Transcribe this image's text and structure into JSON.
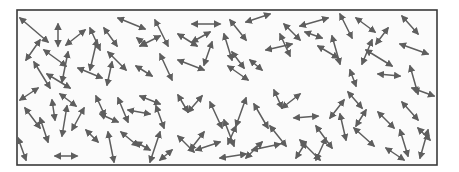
{
  "diagram": {
    "frame": {
      "x": 17,
      "y": 10,
      "width": 420,
      "height": 155
    },
    "colors": {
      "arrow": "#5e5e5e",
      "frame": "#3a3a3a",
      "background": "#fbfbfb"
    },
    "arrow_style": "double-headed",
    "arrows": [
      [
        20,
        18,
        48,
        42
      ],
      [
        58,
        24,
        58,
        46
      ],
      [
        66,
        45,
        85,
        30
      ],
      [
        26,
        60,
        40,
        40
      ],
      [
        44,
        50,
        66,
        66
      ],
      [
        68,
        52,
        62,
        82
      ],
      [
        34,
        62,
        50,
        88
      ],
      [
        47,
        74,
        70,
        88
      ],
      [
        90,
        28,
        100,
        50
      ],
      [
        104,
        28,
        117,
        46
      ],
      [
        97,
        40,
        90,
        70
      ],
      [
        118,
        18,
        145,
        29
      ],
      [
        140,
        46,
        160,
        36
      ],
      [
        108,
        52,
        126,
        70
      ],
      [
        78,
        68,
        102,
        78
      ],
      [
        112,
        62,
        107,
        85
      ],
      [
        137,
        38,
        147,
        46
      ],
      [
        155,
        20,
        168,
        46
      ],
      [
        160,
        54,
        172,
        80
      ],
      [
        136,
        66,
        152,
        76
      ],
      [
        178,
        34,
        197,
        46
      ],
      [
        192,
        24,
        220,
        24
      ],
      [
        192,
        42,
        210,
        32
      ],
      [
        212,
        42,
        204,
        65
      ],
      [
        230,
        20,
        246,
        40
      ],
      [
        224,
        34,
        232,
        60
      ],
      [
        232,
        52,
        244,
        68
      ],
      [
        178,
        60,
        204,
        70
      ],
      [
        228,
        66,
        248,
        80
      ],
      [
        250,
        60,
        262,
        70
      ],
      [
        246,
        22,
        270,
        14
      ],
      [
        284,
        24,
        300,
        40
      ],
      [
        280,
        34,
        290,
        56
      ],
      [
        266,
        50,
        292,
        44
      ],
      [
        300,
        26,
        328,
        18
      ],
      [
        305,
        32,
        322,
        38
      ],
      [
        340,
        14,
        352,
        38
      ],
      [
        332,
        36,
        340,
        64
      ],
      [
        318,
        46,
        338,
        58
      ],
      [
        356,
        18,
        375,
        32
      ],
      [
        372,
        40,
        362,
        64
      ],
      [
        388,
        28,
        376,
        44
      ],
      [
        402,
        16,
        418,
        34
      ],
      [
        400,
        44,
        428,
        54
      ],
      [
        378,
        74,
        400,
        76
      ],
      [
        410,
        66,
        418,
        94
      ],
      [
        366,
        50,
        392,
        66
      ],
      [
        350,
        70,
        356,
        86
      ],
      [
        20,
        100,
        38,
        88
      ],
      [
        25,
        108,
        40,
        128
      ],
      [
        52,
        100,
        55,
        120
      ],
      [
        60,
        94,
        76,
        106
      ],
      [
        67,
        106,
        62,
        136
      ],
      [
        40,
        118,
        48,
        142
      ],
      [
        84,
        108,
        72,
        130
      ],
      [
        86,
        130,
        98,
        142
      ],
      [
        18,
        138,
        26,
        160
      ],
      [
        55,
        156,
        77,
        156
      ],
      [
        96,
        96,
        105,
        116
      ],
      [
        100,
        114,
        118,
        122
      ],
      [
        118,
        98,
        128,
        122
      ],
      [
        128,
        110,
        150,
        114
      ],
      [
        140,
        96,
        160,
        104
      ],
      [
        156,
        106,
        164,
        128
      ],
      [
        121,
        132,
        138,
        146
      ],
      [
        136,
        142,
        150,
        150
      ],
      [
        108,
        132,
        114,
        162
      ],
      [
        160,
        132,
        150,
        162
      ],
      [
        178,
        95,
        188,
        112
      ],
      [
        188,
        112,
        202,
        96
      ],
      [
        210,
        102,
        222,
        128
      ],
      [
        224,
        120,
        234,
        146
      ],
      [
        204,
        132,
        190,
        150
      ],
      [
        196,
        150,
        220,
        142
      ],
      [
        178,
        136,
        194,
        152
      ],
      [
        246,
        98,
        236,
        126
      ],
      [
        236,
        126,
        228,
        144
      ],
      [
        254,
        104,
        268,
        128
      ],
      [
        262,
        142,
        246,
        158
      ],
      [
        270,
        126,
        286,
        146
      ],
      [
        274,
        90,
        282,
        108
      ],
      [
        282,
        108,
        300,
        94
      ],
      [
        294,
        118,
        318,
        116
      ],
      [
        316,
        126,
        332,
        148
      ],
      [
        306,
        142,
        296,
        158
      ],
      [
        326,
        138,
        316,
        160
      ],
      [
        340,
        114,
        346,
        140
      ],
      [
        348,
        92,
        362,
        108
      ],
      [
        366,
        110,
        356,
        126
      ],
      [
        354,
        128,
        374,
        146
      ],
      [
        378,
        112,
        394,
        128
      ],
      [
        402,
        102,
        418,
        120
      ],
      [
        400,
        130,
        408,
        156
      ],
      [
        386,
        148,
        404,
        160
      ],
      [
        418,
        128,
        430,
        140
      ],
      [
        428,
        130,
        420,
        158
      ],
      [
        412,
        88,
        434,
        96
      ],
      [
        344,
        100,
        330,
        118
      ],
      [
        300,
        140,
        320,
        160
      ],
      [
        252,
        150,
        280,
        144
      ],
      [
        220,
        158,
        246,
        154
      ],
      [
        160,
        160,
        172,
        150
      ]
    ]
  }
}
